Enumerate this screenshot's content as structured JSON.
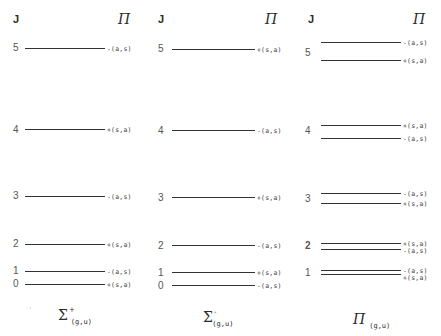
{
  "headers": {
    "j": "J",
    "parity": "Π"
  },
  "panels": [
    {
      "caption": {
        "symbol": "Σ",
        "sup": "+",
        "sub": "(g,u)"
      },
      "levels": [
        {
          "j": "5",
          "parity": "-(a,s)"
        },
        {
          "j": "4",
          "parity": "+(s,a)"
        },
        {
          "j": "3",
          "parity": "-(a,s)"
        },
        {
          "j": "2",
          "parity": "+(s,a)"
        },
        {
          "j": "1",
          "parity": "-(a,s)"
        },
        {
          "j": "0",
          "parity": "+(s,a)"
        }
      ]
    },
    {
      "caption": {
        "symbol": "Σ",
        "sup": "-",
        "sub": "(g,u)"
      },
      "levels": [
        {
          "j": "5",
          "parity": "+(s,a)"
        },
        {
          "j": "4",
          "parity": "-(a,s)"
        },
        {
          "j": "3",
          "parity": "+(s,a)"
        },
        {
          "j": "2",
          "parity": "-(a,s)"
        },
        {
          "j": "1",
          "parity": "+(s,a)"
        },
        {
          "j": "0",
          "parity": "-(a,s)"
        }
      ]
    },
    {
      "caption": {
        "symbol": "Π",
        "sup": "",
        "sub": "(g,u)"
      },
      "levels": [
        {
          "j": "5",
          "upper": "-(a,s)",
          "lower": "+(s,a)"
        },
        {
          "j": "4",
          "upper": "+(s,a)",
          "lower": "-(a,s)"
        },
        {
          "j": "3",
          "upper": "-(a,s)",
          "lower": "+(s,a)"
        },
        {
          "j": "2",
          "upper": "+(s,a)",
          "lower": "-(a,s)"
        },
        {
          "j": "1",
          "upper": "-(a,s)",
          "lower": "+(s,a)"
        }
      ]
    }
  ]
}
